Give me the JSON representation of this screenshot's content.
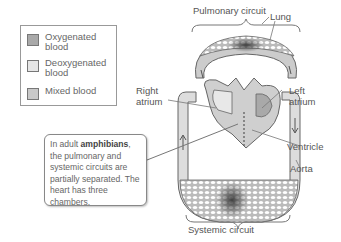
{
  "legend": {
    "items": [
      {
        "label": "Oxygenated\nblood",
        "color": "#a9a9a9"
      },
      {
        "label": "Deoxygenated\nblood",
        "color": "#e6e6e6"
      },
      {
        "label": "Mixed blood",
        "color": "#c8c8c8"
      }
    ]
  },
  "labels": {
    "pulmonary_circuit": "Pulmonary circuit",
    "systemic_circuit": "Systemic circuit",
    "lung": "Lung",
    "right_atrium": "Right\natrium",
    "left_atrium": "Left\natrium",
    "ventricle": "Ventricle",
    "aorta": "Aorta"
  },
  "callout": {
    "prefix": "In adult ",
    "bold": "amphibians",
    "suffix": ", the pulmonary and systemic circuits are partially separated. The heart has three chambers."
  },
  "colors": {
    "oxygenated": "#a9a9a9",
    "deoxygenated": "#e6e6e6",
    "mixed": "#c8c8c8",
    "outline": "#666666"
  }
}
